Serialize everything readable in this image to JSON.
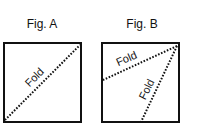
{
  "figures": [
    {
      "title": "Fig. A",
      "folds": [
        {
          "label": "Fold",
          "from": "bottom-left corner",
          "to": "top-right corner"
        }
      ]
    },
    {
      "title": "Fig. B",
      "folds": [
        {
          "label": "Fold",
          "from": "top-right corner",
          "to": "left edge (upper half)"
        },
        {
          "label": "Fold",
          "from": "top-right corner",
          "to": "bottom edge (middle)"
        }
      ]
    }
  ],
  "colors": {
    "ink": "#111111",
    "background": "#ffffff"
  }
}
